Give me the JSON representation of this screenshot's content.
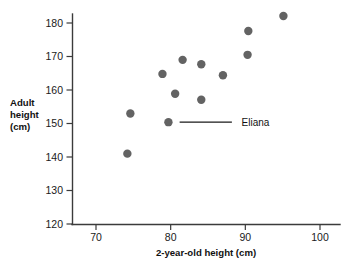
{
  "chart_data": {
    "type": "scatter",
    "title": "",
    "xlabel": "2-year-old height (cm)",
    "ylabel_lines": [
      "Adult",
      "height",
      "(cm)"
    ],
    "ylabel": "Adult height (cm)",
    "xlim": [
      65,
      102
    ],
    "ylim": [
      120,
      184
    ],
    "xticks": [
      70,
      80,
      90,
      100
    ],
    "yticks": [
      120,
      130,
      140,
      150,
      160,
      170,
      180
    ],
    "xtick_labels": [
      "70",
      "80",
      "90",
      "100"
    ],
    "ytick_labels": [
      "120",
      "130",
      "140",
      "150",
      "160",
      "170",
      "180"
    ],
    "grid": false,
    "legend": "none",
    "marker": "filled-circle",
    "marker_color": "#636363",
    "axis_color": "#3b3b3b",
    "points": [
      {
        "x": 74.2,
        "y": 141.0
      },
      {
        "x": 74.6,
        "y": 153.0
      },
      {
        "x": 78.9,
        "y": 164.8
      },
      {
        "x": 79.7,
        "y": 150.4,
        "label": "Eliana"
      },
      {
        "x": 80.6,
        "y": 158.9
      },
      {
        "x": 81.6,
        "y": 169.0
      },
      {
        "x": 84.1,
        "y": 167.7
      },
      {
        "x": 84.1,
        "y": 157.1
      },
      {
        "x": 87.0,
        "y": 164.4
      },
      {
        "x": 90.3,
        "y": 170.5
      },
      {
        "x": 90.4,
        "y": 177.6
      },
      {
        "x": 95.1,
        "y": 182.1
      }
    ],
    "annotations": [
      {
        "text": "Eliana",
        "point_x": 79.7,
        "point_y": 150.4,
        "line_from_x": 81.2,
        "line_to_x": 88.2,
        "text_x": 89.5
      }
    ]
  }
}
